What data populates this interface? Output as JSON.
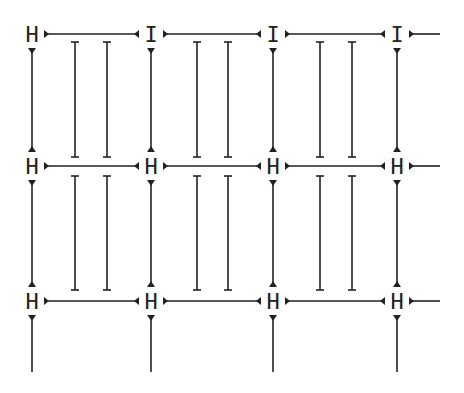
{
  "diagram": {
    "stroke_color": "#222222",
    "background": "#ffffff",
    "columns_x": [
      32,
      151,
      273,
      397
    ],
    "rows_y": [
      34,
      166,
      301
    ],
    "row_glyphs": [
      [
        "H",
        "I",
        "I",
        "I"
      ],
      [
        "H",
        "H",
        "H",
        "H"
      ],
      [
        "H",
        "H",
        "H",
        "H"
      ]
    ],
    "inner_lines_x": [
      [
        75,
        107
      ],
      [
        197,
        228
      ],
      [
        320,
        352
      ]
    ],
    "inner_line_spans": [
      [
        42,
        157
      ],
      [
        176,
        290
      ]
    ],
    "bottom_line_end_y": 372,
    "trailing_line_end_x": 440
  }
}
